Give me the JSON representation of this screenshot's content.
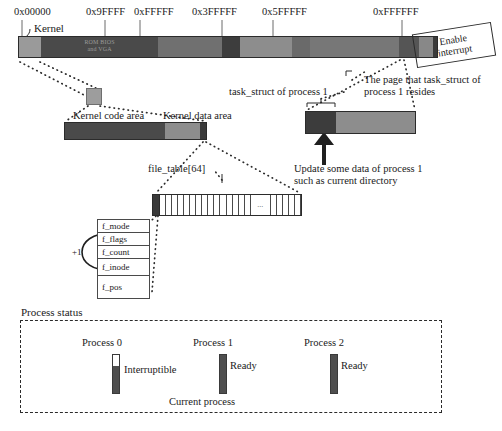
{
  "memory_map": {
    "addresses": [
      {
        "label": "0x00000",
        "x": 14,
        "tick_x": 22
      },
      {
        "label": "0x9FFFF",
        "x": 90,
        "tick_x": 105
      },
      {
        "label": "0xFFFFF",
        "x": 133,
        "tick_x": 140
      },
      {
        "label": "0x3FFFFF",
        "x": 190,
        "tick_x": 222
      },
      {
        "label": "0x5FFFFF",
        "x": 260,
        "tick_x": 273
      },
      {
        "label": "0xFFFFFF",
        "x": 374,
        "tick_x": 402
      }
    ],
    "kernel_label": "Kernel",
    "rom_bios_line1": "ROM BIOS",
    "rom_bios_line2": "and VGA",
    "segments": [
      {
        "name": "kernel",
        "width": 22,
        "color": "#9a9a9a"
      },
      {
        "name": "rom-bios",
        "width": 118,
        "color": "#4a4a4a"
      },
      {
        "name": "ext-mem-1",
        "width": 64,
        "color": "#707070"
      },
      {
        "name": "ext-mem-2",
        "width": 18,
        "color": "#3d3d3d"
      },
      {
        "name": "ext-mem-3",
        "width": 52,
        "color": "#8d8d8d"
      },
      {
        "name": "ext-mem-4",
        "width": 18,
        "color": "#6a6a6a"
      },
      {
        "name": "ext-mem-5",
        "width": 90,
        "color": "#777777"
      },
      {
        "name": "ext-mem-6",
        "width": 20,
        "color": "#555555"
      },
      {
        "name": "ext-mem-7",
        "width": 14,
        "color": "#888888"
      },
      {
        "name": "last-page",
        "width": 4,
        "color": "#3a3a3a"
      }
    ]
  },
  "enable_interrupt": {
    "line1": "Enable",
    "line2": "interrupt"
  },
  "kernel_detail": {
    "code_area_label": "Kernel code area",
    "data_area_label": "Kernel data area",
    "segments": [
      {
        "name": "kernel-code",
        "width": 100,
        "color": "#4a4a4a"
      },
      {
        "name": "kernel-data",
        "width": 35,
        "color": "#8d8d8d"
      },
      {
        "name": "file-table-marker",
        "width": 6,
        "color": "#3a3a3a"
      }
    ]
  },
  "task_struct": {
    "pointer_label": "task_struct of process 1",
    "page_label_line1": "The page that task_struct of",
    "page_label_line2": "process 1 resides",
    "update_note_line1": "Update some data of process 1",
    "update_note_line2": "such as current directory",
    "segments": [
      {
        "name": "task-struct-region",
        "width": 30,
        "color": "#3c3c3c"
      },
      {
        "name": "rest-of-page",
        "width": 79,
        "color": "#8d8d8d"
      }
    ]
  },
  "file_table": {
    "label": "file_table[64]",
    "ellipsis": "...",
    "cell_count": 22
  },
  "file_struct": {
    "fields": [
      "f_mode",
      "f_flags",
      "f_count",
      "f_inode",
      "f_pos"
    ],
    "increment_label": "+1"
  },
  "process_status": {
    "title": "Process status",
    "current_process_label": "Current process",
    "processes": [
      {
        "name": "Process 0",
        "state": "Interruptible",
        "fill_pct": 72,
        "name_x": 82,
        "bar_x": 112,
        "state_x": 124
      },
      {
        "name": "Process 1",
        "state": "Ready",
        "fill_pct": 100,
        "name_x": 193,
        "bar_x": 219,
        "state_x": 230
      },
      {
        "name": "Process 2",
        "state": "Ready",
        "fill_pct": 100,
        "name_x": 304,
        "bar_x": 330,
        "state_x": 341
      }
    ]
  },
  "colors": {
    "ink": "#1a1a1a",
    "line": "#2b2b2b",
    "fill_dark": "#4f4f4f",
    "fill_mid": "#8d8d8d"
  }
}
